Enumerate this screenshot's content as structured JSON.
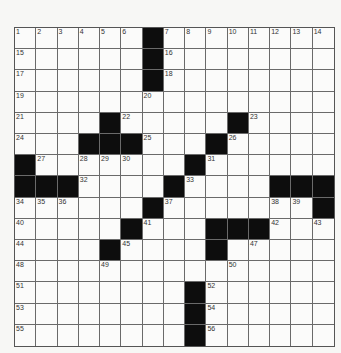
{
  "puzzle": {
    "rows": 15,
    "cols": 15,
    "layout": [
      "......#........",
      "......#........",
      "......#........",
      "...............",
      "....#.....#....",
      "...###...#.....",
      "#.......#......",
      "###....#....###",
      "......#.......#",
      ".....#...###...",
      "....#....#.....",
      "...............",
      "........#......",
      "........#......",
      "........#......"
    ],
    "numbers": [
      {
        "r": 0,
        "c": 0,
        "n": "1"
      },
      {
        "r": 0,
        "c": 1,
        "n": "2"
      },
      {
        "r": 0,
        "c": 2,
        "n": "3"
      },
      {
        "r": 0,
        "c": 3,
        "n": "4"
      },
      {
        "r": 0,
        "c": 4,
        "n": "5"
      },
      {
        "r": 0,
        "c": 5,
        "n": "6"
      },
      {
        "r": 0,
        "c": 7,
        "n": "7"
      },
      {
        "r": 0,
        "c": 8,
        "n": "8"
      },
      {
        "r": 0,
        "c": 9,
        "n": "9"
      },
      {
        "r": 0,
        "c": 10,
        "n": "10"
      },
      {
        "r": 0,
        "c": 11,
        "n": "11"
      },
      {
        "r": 0,
        "c": 12,
        "n": "12"
      },
      {
        "r": 0,
        "c": 13,
        "n": "13"
      },
      {
        "r": 0,
        "c": 14,
        "n": "14"
      },
      {
        "r": 1,
        "c": 0,
        "n": "15"
      },
      {
        "r": 1,
        "c": 7,
        "n": "16"
      },
      {
        "r": 2,
        "c": 0,
        "n": "17"
      },
      {
        "r": 2,
        "c": 7,
        "n": "18"
      },
      {
        "r": 3,
        "c": 0,
        "n": "19"
      },
      {
        "r": 3,
        "c": 6,
        "n": "20"
      },
      {
        "r": 4,
        "c": 0,
        "n": "21"
      },
      {
        "r": 4,
        "c": 5,
        "n": "22"
      },
      {
        "r": 4,
        "c": 11,
        "n": "23"
      },
      {
        "r": 5,
        "c": 0,
        "n": "24"
      },
      {
        "r": 5,
        "c": 6,
        "n": "25"
      },
      {
        "r": 5,
        "c": 10,
        "n": "26"
      },
      {
        "r": 6,
        "c": 1,
        "n": "27"
      },
      {
        "r": 6,
        "c": 3,
        "n": "28"
      },
      {
        "r": 6,
        "c": 4,
        "n": "29"
      },
      {
        "r": 6,
        "c": 5,
        "n": "30"
      },
      {
        "r": 6,
        "c": 9,
        "n": "31"
      },
      {
        "r": 7,
        "c": 3,
        "n": "32"
      },
      {
        "r": 7,
        "c": 8,
        "n": "33"
      },
      {
        "r": 8,
        "c": 0,
        "n": "34"
      },
      {
        "r": 8,
        "c": 1,
        "n": "35"
      },
      {
        "r": 8,
        "c": 2,
        "n": "36"
      },
      {
        "r": 8,
        "c": 7,
        "n": "37"
      },
      {
        "r": 8,
        "c": 12,
        "n": "38"
      },
      {
        "r": 8,
        "c": 13,
        "n": "39"
      },
      {
        "r": 9,
        "c": 0,
        "n": "40"
      },
      {
        "r": 9,
        "c": 6,
        "n": "41"
      },
      {
        "r": 9,
        "c": 12,
        "n": "42"
      },
      {
        "r": 9,
        "c": 14,
        "n": "43"
      },
      {
        "r": 10,
        "c": 0,
        "n": "44"
      },
      {
        "r": 10,
        "c": 5,
        "n": "45"
      },
      {
        "r": 10,
        "c": 9,
        "n": "46"
      },
      {
        "r": 10,
        "c": 11,
        "n": "47"
      },
      {
        "r": 11,
        "c": 0,
        "n": "48"
      },
      {
        "r": 11,
        "c": 4,
        "n": "49"
      },
      {
        "r": 11,
        "c": 10,
        "n": "50"
      },
      {
        "r": 12,
        "c": 0,
        "n": "51"
      },
      {
        "r": 12,
        "c": 9,
        "n": "52"
      },
      {
        "r": 13,
        "c": 0,
        "n": "53"
      },
      {
        "r": 13,
        "c": 9,
        "n": "54"
      },
      {
        "r": 14,
        "c": 0,
        "n": "55"
      },
      {
        "r": 14,
        "c": 9,
        "n": "56"
      }
    ],
    "colors": {
      "black_square": "#0d0d0d",
      "white_square": "#fbfbfa",
      "grid_line": "#6a6a6a",
      "number_text": "#333333"
    }
  }
}
